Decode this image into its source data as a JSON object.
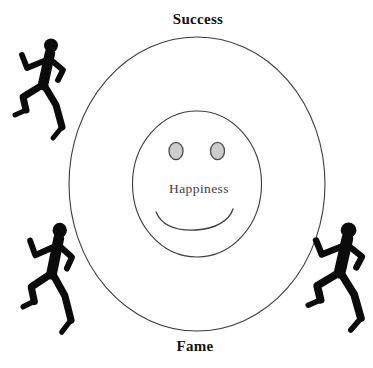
{
  "diagram": {
    "labels": {
      "top": "Success",
      "bottom": "Fame",
      "center": "Happiness"
    },
    "icons": {
      "runner": "running-person-silhouette",
      "runner_count": 3,
      "face": "smiley-face"
    },
    "colors": {
      "background": "#ffffff",
      "line": "#3c3c3c",
      "eye_fill": "#cdcdcd",
      "eye_stroke": "#4a4a4a",
      "runner_fill": "#0b0b0b",
      "title_color": "#111111",
      "center_label_color": "#3e3e3e"
    }
  }
}
